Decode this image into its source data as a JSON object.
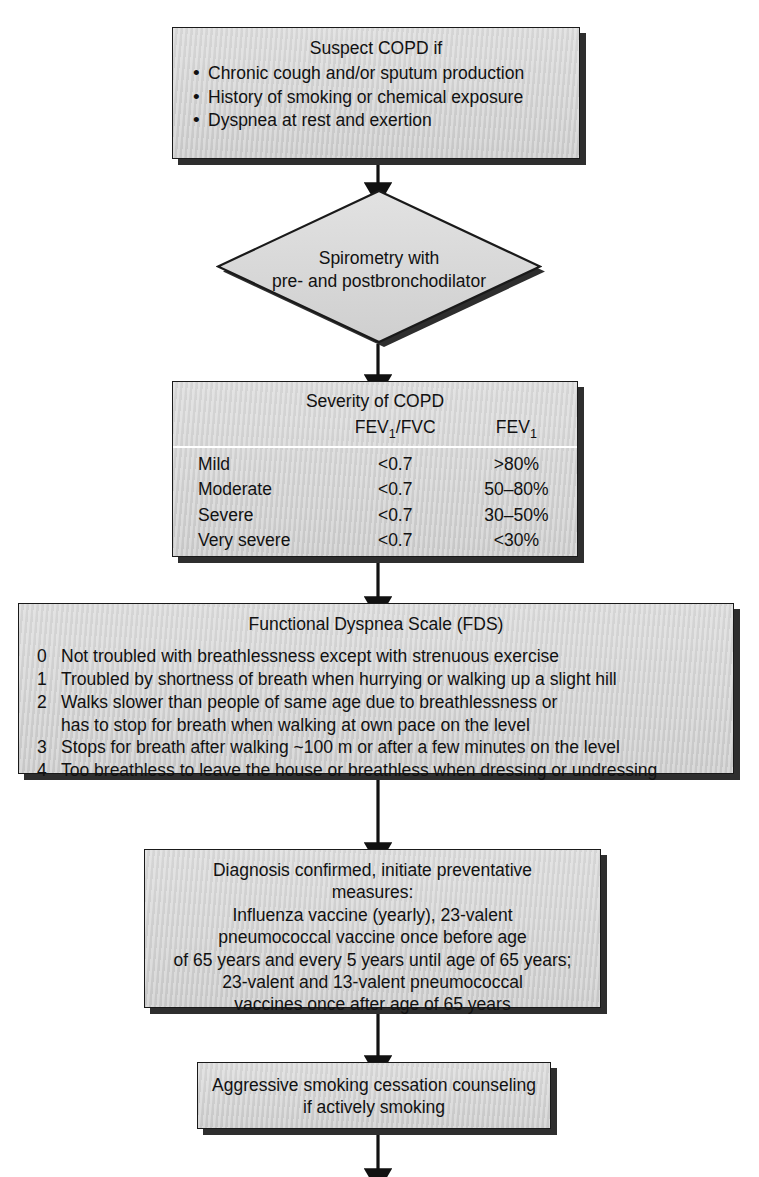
{
  "diagram": {
    "colors": {
      "node_fill": "#d6d6d6",
      "node_border": "#1a1a1a",
      "node_shadow": "#2e2e2e",
      "connector": "#111111",
      "table_rule": "#ffffff"
    },
    "nodes": {
      "suspect": {
        "shape": "rectangle",
        "title": "Suspect COPD if",
        "bullets": [
          "Chronic cough and/or sputum production",
          "History of smoking or chemical exposure",
          "Dyspnea at rest and exertion"
        ]
      },
      "spirometry": {
        "shape": "diamond",
        "line1": "Spirometry with",
        "line2": "pre- and postbronchodilator"
      },
      "severity": {
        "shape": "rectangle",
        "title": "Severity of COPD",
        "columns": [
          "",
          "FEV₁/FVC",
          "FEV₁"
        ],
        "column_html": [
          "",
          "FEV<sub>1</sub>/FVC",
          "FEV<sub>1</sub>"
        ],
        "rows": [
          {
            "severity": "Mild",
            "fev1_fvc": "<0.7",
            "fev1": ">80%"
          },
          {
            "severity": "Moderate",
            "fev1_fvc": "<0.7",
            "fev1": "50–80%"
          },
          {
            "severity": "Severe",
            "fev1_fvc": "<0.7",
            "fev1": "30–50%"
          },
          {
            "severity": "Very severe",
            "fev1_fvc": "<0.7",
            "fev1": "<30%"
          }
        ]
      },
      "fds": {
        "shape": "rectangle",
        "title": "Functional Dyspnea Scale (FDS)",
        "items": [
          {
            "grade": "0",
            "text": "Not troubled with breathlessness except with strenuous exercise",
            "cont": ""
          },
          {
            "grade": "1",
            "text": "Troubled by shortness of breath when hurrying or walking up a slight hill",
            "cont": ""
          },
          {
            "grade": "2",
            "text": "Walks slower than people of same age due to breathlessness or",
            "cont": "has to stop for breath when walking at own pace on the level"
          },
          {
            "grade": "3",
            "text": "Stops for breath after walking ~100 m or after a few minutes on the level",
            "cont": ""
          },
          {
            "grade": "4",
            "text": "Too breathless to leave the house or breathless when dressing or undressing",
            "cont": ""
          }
        ]
      },
      "diagnosis": {
        "shape": "rectangle",
        "lines": [
          "Diagnosis confirmed, initiate preventative",
          "measures:",
          "Influenza vaccine (yearly), 23-valent",
          "pneumococcal vaccine once before age",
          "of 65 years and every 5 years until age of 65 years;",
          "23-valent and 13-valent pneumococcal",
          "vaccines once after age of 65 years"
        ]
      },
      "cessation": {
        "shape": "rectangle",
        "lines": [
          "Aggressive smoking cessation counseling",
          "if actively smoking"
        ]
      }
    },
    "connectors": [
      {
        "name": "suspect-to-spirometry",
        "from": "suspect",
        "to": "spirometry",
        "arrow": "down"
      },
      {
        "name": "spirometry-to-severity",
        "from": "spirometry",
        "to": "severity",
        "arrow": "down"
      },
      {
        "name": "severity-to-fds",
        "from": "severity",
        "to": "fds",
        "arrow": "down"
      },
      {
        "name": "fds-to-diagnosis",
        "from": "fds",
        "to": "diagnosis",
        "arrow": "down"
      },
      {
        "name": "diagnosis-to-cessation",
        "from": "diagnosis",
        "to": "cessation",
        "arrow": "down"
      },
      {
        "name": "cessation-to-next",
        "from": "cessation",
        "to": "",
        "arrow": "down"
      }
    ]
  }
}
